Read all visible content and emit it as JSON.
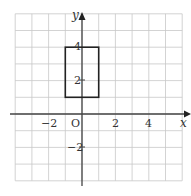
{
  "diagram": {
    "type": "coordinate-grid",
    "x_range": [
      -4,
      6
    ],
    "y_range": [
      -4,
      6
    ],
    "grid_step": 1,
    "axes": {
      "x_label": "x",
      "y_label": "y",
      "origin_label": "O"
    },
    "x_ticks": [
      {
        "value": -2,
        "label": "−2"
      },
      {
        "value": 2,
        "label": "2"
      },
      {
        "value": 4,
        "label": "4"
      }
    ],
    "y_ticks": [
      {
        "value": 4,
        "label": "4"
      },
      {
        "value": 2,
        "label": "2"
      },
      {
        "value": -2,
        "label": "−2"
      }
    ],
    "shapes": [
      {
        "type": "rectangle",
        "x1": -1,
        "y1": 1,
        "x2": 1,
        "y2": 4
      }
    ],
    "colors": {
      "grid": "#c8c8c8",
      "axis": "#444444",
      "shape": "#222222"
    }
  }
}
